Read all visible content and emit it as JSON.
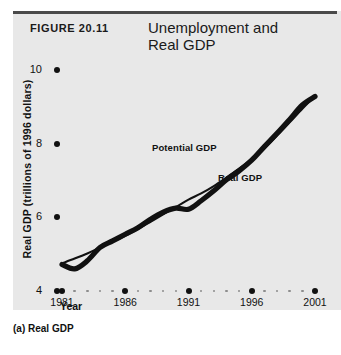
{
  "figure": {
    "number": "FIGURE 20.11",
    "title": "Unemployment and\nReal GDP",
    "caption": "(a) Real GDP",
    "panel_background": "#e8e8e8",
    "rule_color": "#4a4a4a"
  },
  "chart_data": {
    "type": "line",
    "title": "Unemployment and Real GDP",
    "xlabel": "Year",
    "ylabel": "Real GDP (trillions of 1996 dollars)",
    "xlim": [
      1981,
      2001
    ],
    "ylim": [
      4,
      10
    ],
    "yticks": [
      4,
      6,
      8,
      10
    ],
    "xticks": [
      1981,
      1986,
      1991,
      1996,
      2001
    ],
    "minor_ticks_between": 4,
    "grid": false,
    "legend_position": "inline-annotations",
    "annotations": [
      {
        "text": "Potential GDP",
        "x": 1988.0,
        "y": 7.35
      },
      {
        "text": "Real GDP",
        "x": 1992.5,
        "y": 6.65
      }
    ],
    "series": [
      {
        "name": "Potential GDP",
        "color": "#111111",
        "x": [
          1981,
          1982,
          1983,
          1984,
          1985,
          1986,
          1987,
          1988,
          1989,
          1990,
          1991,
          1992,
          1993,
          1994,
          1995,
          1996,
          1997,
          1998,
          1999,
          2000,
          2001
        ],
        "values": [
          4.75,
          4.88,
          5.02,
          5.18,
          5.34,
          5.5,
          5.68,
          5.88,
          6.08,
          6.28,
          6.48,
          6.65,
          6.85,
          7.08,
          7.32,
          7.58,
          7.88,
          8.22,
          8.58,
          8.95,
          9.3
        ]
      },
      {
        "name": "Real GDP",
        "color": "#111111",
        "x": [
          1981,
          1982,
          1983,
          1984,
          1985,
          1986,
          1987,
          1988,
          1989,
          1990,
          1991,
          1992,
          1993,
          1994,
          1995,
          1996,
          1997,
          1998,
          1999,
          2000,
          2001
        ],
        "values": [
          4.72,
          4.6,
          4.82,
          5.18,
          5.36,
          5.54,
          5.72,
          5.95,
          6.14,
          6.25,
          6.22,
          6.45,
          6.72,
          7.02,
          7.26,
          7.55,
          7.92,
          8.28,
          8.66,
          9.05,
          9.28
        ]
      }
    ]
  }
}
